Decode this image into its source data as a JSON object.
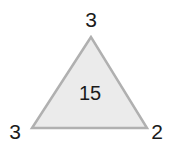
{
  "diagram": {
    "shape": "triangle",
    "fill_color": "#ebebeb",
    "stroke_color": "#b0b0b0",
    "vertices": {
      "top": "3",
      "bottom_left": "3",
      "bottom_right": "2"
    },
    "center": "15"
  }
}
